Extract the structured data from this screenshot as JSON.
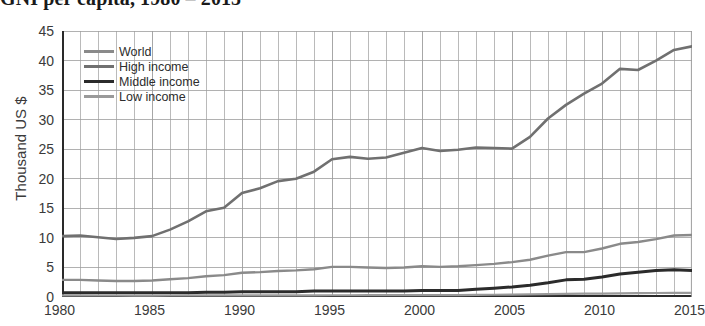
{
  "title": "GNI per capita, 1980 – 2015",
  "axis": {
    "ylabel": "Thousand US $",
    "xlabel": ""
  },
  "legend": {
    "items": [
      {
        "label": "World",
        "color": "#8a8a8a",
        "width": 2.6
      },
      {
        "label": "High income",
        "color": "#707070",
        "width": 2.8
      },
      {
        "label": "Middle income",
        "color": "#2b2b2b",
        "width": 3.4
      },
      {
        "label": "Low income",
        "color": "#9a9a9a",
        "width": 2.4
      }
    ]
  },
  "chart_data": {
    "type": "line",
    "title": "GNI per capita, 1980 – 2015",
    "xlabel": "",
    "ylabel": "Thousand US $",
    "xlim": [
      1980,
      2015
    ],
    "ylim": [
      0,
      45
    ],
    "ytick_labels": [
      "0",
      "5",
      "10",
      "15",
      "20",
      "25",
      "30",
      "35",
      "40",
      "45"
    ],
    "yticks": [
      0,
      5,
      10,
      15,
      20,
      25,
      30,
      35,
      40,
      45
    ],
    "xtick_labels": [
      "1980",
      "1985",
      "1990",
      "1995",
      "2000",
      "2005",
      "2010",
      "2015"
    ],
    "xticks": [
      1980,
      1985,
      1990,
      1995,
      2000,
      2005,
      2010,
      2015
    ],
    "grid": true,
    "legend_position": "upper-left-inside",
    "x": [
      1980,
      1981,
      1982,
      1983,
      1984,
      1985,
      1986,
      1987,
      1988,
      1989,
      1990,
      1991,
      1992,
      1993,
      1994,
      1995,
      1996,
      1997,
      1998,
      1999,
      2000,
      2001,
      2002,
      2003,
      2004,
      2005,
      2006,
      2007,
      2008,
      2009,
      2010,
      2011,
      2012,
      2013,
      2014,
      2015
    ],
    "series": [
      {
        "name": "High income",
        "color": "#707070",
        "values": [
          10.3,
          10.4,
          10.1,
          9.8,
          10.0,
          10.3,
          11.4,
          12.8,
          14.5,
          15.1,
          17.6,
          18.4,
          19.6,
          20.0,
          21.2,
          23.3,
          23.7,
          23.4,
          23.6,
          24.4,
          25.2,
          24.7,
          24.9,
          25.3,
          25.2,
          25.1,
          27.1,
          30.2,
          32.5,
          34.4,
          36.1,
          38.6,
          38.4,
          40.0,
          41.8,
          42.4
        ]
      },
      {
        "name": "World",
        "color": "#8a8a8a",
        "values": [
          2.9,
          2.9,
          2.8,
          2.7,
          2.7,
          2.8,
          3.0,
          3.2,
          3.5,
          3.7,
          4.1,
          4.2,
          4.4,
          4.5,
          4.7,
          5.1,
          5.1,
          5.0,
          4.9,
          5.0,
          5.2,
          5.1,
          5.2,
          5.4,
          5.6,
          5.9,
          6.3,
          7.0,
          7.6,
          7.6,
          8.2,
          9.0,
          9.3,
          9.8,
          10.4,
          10.5
        ]
      },
      {
        "name": "Middle income",
        "color": "#2b2b2b",
        "values": [
          0.7,
          0.7,
          0.7,
          0.7,
          0.7,
          0.7,
          0.7,
          0.7,
          0.8,
          0.8,
          0.9,
          0.9,
          0.9,
          0.9,
          1.0,
          1.0,
          1.0,
          1.0,
          1.0,
          1.0,
          1.1,
          1.1,
          1.1,
          1.3,
          1.5,
          1.7,
          2.0,
          2.4,
          2.9,
          3.0,
          3.4,
          3.9,
          4.2,
          4.5,
          4.6,
          4.5
        ]
      },
      {
        "name": "Low income",
        "color": "#9a9a9a",
        "values": [
          0.26,
          0.26,
          0.25,
          0.25,
          0.24,
          0.24,
          0.25,
          0.26,
          0.27,
          0.27,
          0.28,
          0.29,
          0.29,
          0.28,
          0.28,
          0.3,
          0.3,
          0.31,
          0.31,
          0.31,
          0.32,
          0.32,
          0.33,
          0.35,
          0.38,
          0.41,
          0.44,
          0.49,
          0.54,
          0.56,
          0.58,
          0.62,
          0.65,
          0.68,
          0.7,
          0.7
        ]
      }
    ]
  },
  "colors": {
    "grid": "#9d9d9d",
    "axis": "#2a2a2a",
    "text": "#3a3a3a"
  }
}
